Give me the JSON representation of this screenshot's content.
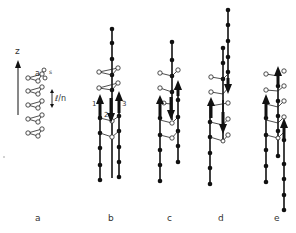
{
  "figure": {
    "axis_label": "z",
    "annotations": {
      "a_label": "a",
      "s_label": "s",
      "spacing_label": "ℓ/n",
      "arrow_1": "1",
      "arrow_2": "2",
      "arrow_3": "3"
    },
    "panels": [
      {
        "id": "a",
        "label": "a"
      },
      {
        "id": "b",
        "label": "b"
      },
      {
        "id": "c",
        "label": "c"
      },
      {
        "id": "d",
        "label": "d"
      },
      {
        "id": "e",
        "label": "e"
      }
    ],
    "colors": {
      "ink": "#111111",
      "background": "#ffffff"
    }
  }
}
